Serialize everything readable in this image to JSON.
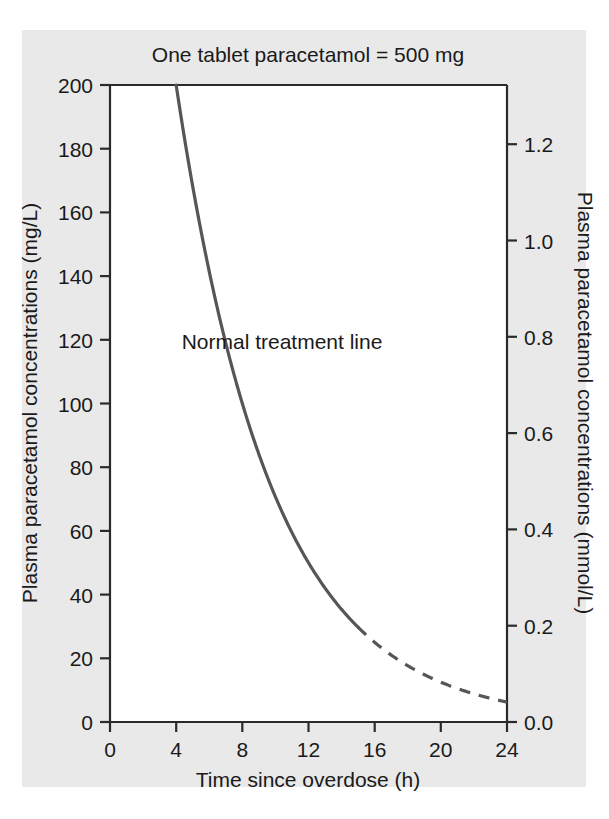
{
  "chart_data": {
    "type": "line",
    "title": "One tablet paracetamol = 500 mg",
    "xlabel": "Time since overdose (h)",
    "ylabel": "Plasma paracetamol concentrations (mg/L)",
    "ylabel_right": "Plasma paracetamol concentrations (mmol/L)",
    "xlim": [
      0,
      24
    ],
    "ylim": [
      0,
      200
    ],
    "ylim_right": [
      0.0,
      1.3245
    ],
    "grid": false,
    "legend": "none",
    "xticks": [
      0,
      4,
      8,
      12,
      16,
      20,
      24
    ],
    "xticklabels": [
      "0",
      "4",
      "8",
      "12",
      "16",
      "20",
      "24"
    ],
    "yticks": [
      0,
      20,
      40,
      60,
      80,
      100,
      120,
      140,
      160,
      180,
      200
    ],
    "yticklabels": [
      "0",
      "20",
      "40",
      "60",
      "80",
      "100",
      "120",
      "140",
      "160",
      "180",
      "200"
    ],
    "yticks_right": [
      0.0,
      0.2,
      0.4,
      0.6,
      0.8,
      1.0,
      1.2
    ],
    "yticklabels_right": [
      "0.0",
      "0.2",
      "0.4",
      "0.6",
      "0.8",
      "1.0",
      "1.2"
    ],
    "annotations": [
      {
        "text": "Normal treatment line",
        "x": 10.4,
        "y": 117
      }
    ],
    "series": [
      {
        "name": "Normal treatment line",
        "color": "#55555a",
        "style_solid_range": [
          4,
          15
        ],
        "style_dashed_range": [
          15,
          24
        ],
        "half_life_hours": 4.0,
        "x": [
          4,
          5,
          6,
          7,
          8,
          9,
          10,
          11,
          12,
          13,
          14,
          15,
          16,
          17,
          18,
          19,
          20,
          21,
          22,
          23,
          24
        ],
        "y": [
          200,
          168,
          141,
          119,
          100,
          84,
          71,
          59,
          50,
          42,
          35,
          30,
          25,
          21,
          17.7,
          14.9,
          12.5,
          10.5,
          8.8,
          7.4,
          6.3
        ]
      }
    ]
  },
  "axes": {
    "title": "One tablet paracetamol = 500 mg",
    "x_title": "Time since overdose (h)",
    "y_left_title": "Plasma paracetamol concentrations (mg/L)",
    "y_right_title": "Plasma paracetamol concentrations (mmol/L)"
  },
  "labels": {
    "x": [
      "0",
      "4",
      "8",
      "12",
      "16",
      "20",
      "24"
    ],
    "y_left": [
      "200",
      "180",
      "160",
      "140",
      "120",
      "100",
      "80",
      "60",
      "40",
      "20",
      "0"
    ],
    "y_right": [
      "1.2",
      "1.0",
      "0.8",
      "0.6",
      "0.4",
      "0.2",
      "0.0"
    ]
  },
  "annotation": {
    "treatment_line": "Normal treatment line"
  },
  "colors": {
    "line": "#55555a",
    "frame": "#2a2a2a",
    "panel_background": "#e9e9e9",
    "plot_background": "#ffffff",
    "text": "#1a1a1a"
  }
}
